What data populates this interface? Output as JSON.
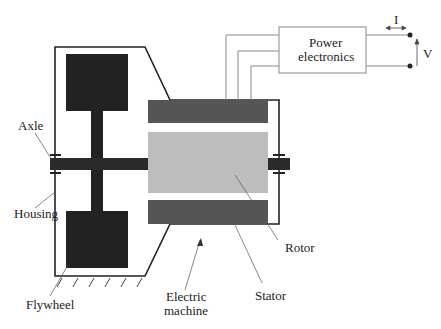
{
  "diagram": {
    "labels": {
      "axle": "Axle",
      "housing": "Housing",
      "flywheel": "Flywheel",
      "electric_machine_line1": "Electric",
      "electric_machine_line2": "machine",
      "rotor": "Rotor",
      "stator": "Stator",
      "power_electronics_line1": "Power",
      "power_electronics_line2": "electronics",
      "current": "I",
      "voltage": "V"
    },
    "colors": {
      "flywheel": "#222222",
      "stator": "#555555",
      "rotor": "#bdbdbd",
      "housing": "#222222",
      "wire": "#888888"
    }
  }
}
